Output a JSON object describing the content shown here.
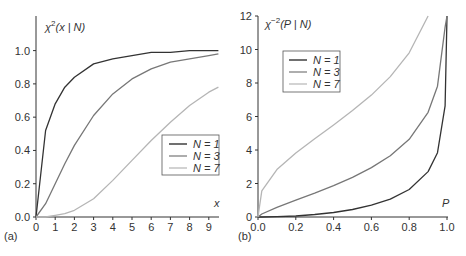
{
  "chart_data": [
    {
      "panel": "(a)",
      "type": "line",
      "title": "",
      "ylabel": "χ²(x | N)",
      "xlabel": "x",
      "xlim": [
        0,
        9.5
      ],
      "ylim": [
        0,
        1.1
      ],
      "xticks": [
        "0",
        "1",
        "2",
        "3",
        "4",
        "5",
        "6",
        "7",
        "8",
        "9"
      ],
      "yticks": [
        "0.0",
        "0.2",
        "0.4",
        "0.6",
        "0.8",
        "1.0"
      ],
      "grid": false,
      "legend_position": "right-middle",
      "x": [
        0,
        0.5,
        1,
        1.5,
        2,
        3,
        4,
        5,
        6,
        7,
        8,
        9,
        9.5
      ],
      "series": [
        {
          "name": "N = 1",
          "color": "#333333",
          "values": [
            0,
            0.52,
            0.68,
            0.78,
            0.84,
            0.92,
            0.95,
            0.97,
            0.99,
            0.99,
            1.0,
            1.0,
            1.0
          ]
        },
        {
          "name": "N = 3",
          "color": "#777777",
          "values": [
            0,
            0.08,
            0.2,
            0.32,
            0.43,
            0.61,
            0.74,
            0.83,
            0.89,
            0.93,
            0.95,
            0.97,
            0.98
          ]
        },
        {
          "name": "N = 7",
          "color": "#b5b5b5",
          "values": [
            0,
            0.0,
            0.01,
            0.02,
            0.04,
            0.11,
            0.22,
            0.34,
            0.46,
            0.57,
            0.67,
            0.75,
            0.78
          ]
        }
      ]
    },
    {
      "panel": "(b)",
      "type": "line",
      "title": "",
      "ylabel": "χ⁻²(P | N)",
      "xlabel": "P",
      "xlim": [
        0,
        1.0
      ],
      "ylim": [
        0,
        12
      ],
      "xticks": [
        "0.0",
        "0.2",
        "0.4",
        "0.6",
        "0.8",
        "1.0"
      ],
      "yticks": [
        "0",
        "2",
        "4",
        "6",
        "8",
        "10",
        "12"
      ],
      "grid": false,
      "legend_position": "upper-left",
      "x": [
        0,
        0.02,
        0.1,
        0.2,
        0.3,
        0.4,
        0.5,
        0.6,
        0.7,
        0.8,
        0.9,
        0.95,
        0.99,
        1.0
      ],
      "series": [
        {
          "name": "N = 1",
          "color": "#333333",
          "values": [
            0,
            0.0,
            0.02,
            0.06,
            0.15,
            0.27,
            0.45,
            0.71,
            1.07,
            1.64,
            2.71,
            3.84,
            6.63,
            12
          ]
        },
        {
          "name": "N = 3",
          "color": "#777777",
          "values": [
            0,
            0.18,
            0.58,
            1.01,
            1.42,
            1.87,
            2.37,
            2.95,
            3.66,
            4.64,
            6.25,
            7.81,
            11.34,
            12
          ]
        },
        {
          "name": "N = 7",
          "color": "#b5b5b5",
          "values": [
            0,
            1.56,
            2.83,
            3.82,
            4.67,
            5.49,
            6.35,
            7.28,
            8.38,
            9.8,
            12.0,
            null,
            null,
            null
          ]
        }
      ]
    }
  ],
  "panels": {
    "a": {
      "label": "(a)",
      "ylabel_main": "χ",
      "ylabel_sup": "2",
      "ylabel_rest": "(x | N)",
      "xlabel": "x",
      "legend": [
        "N = 1",
        "N = 3",
        "N = 7"
      ]
    },
    "b": {
      "label": "(b)",
      "ylabel_main": "χ",
      "ylabel_sup": "−2",
      "ylabel_rest": "(P | N)",
      "xlabel": "P",
      "legend": [
        "N = 1",
        "N = 3",
        "N = 7"
      ]
    }
  }
}
